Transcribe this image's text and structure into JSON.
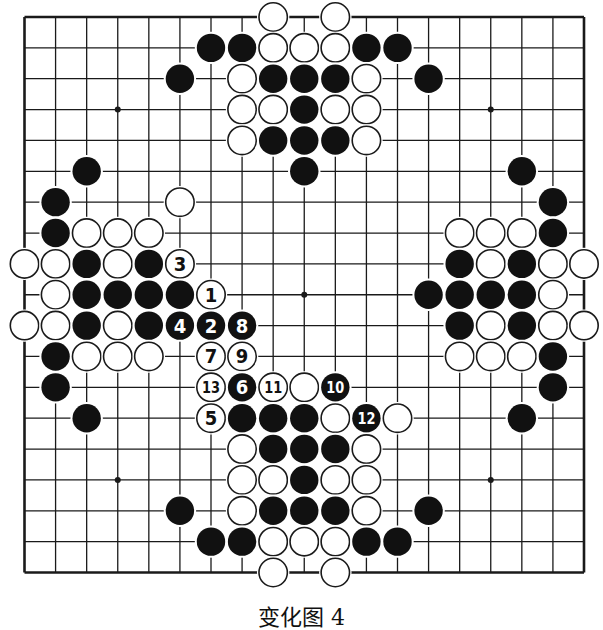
{
  "figure": {
    "caption": "变化图 4",
    "board_size": 19,
    "colors": {
      "background": "#ffffff",
      "line": "#1a1a1a",
      "black_stone": "#111111",
      "white_stone": "#ffffff",
      "stone_outline": "#1a1a1a"
    },
    "star_points": [
      [
        3,
        3
      ],
      [
        15,
        3
      ],
      [
        9,
        9
      ],
      [
        3,
        15
      ],
      [
        15,
        15
      ]
    ],
    "stones": [
      {
        "c": 8,
        "r": 0,
        "color": "W"
      },
      {
        "c": 10,
        "r": 0,
        "color": "W"
      },
      {
        "c": 6,
        "r": 1,
        "color": "B"
      },
      {
        "c": 7,
        "r": 1,
        "color": "B"
      },
      {
        "c": 8,
        "r": 1,
        "color": "W"
      },
      {
        "c": 9,
        "r": 1,
        "color": "W"
      },
      {
        "c": 10,
        "r": 1,
        "color": "W"
      },
      {
        "c": 11,
        "r": 1,
        "color": "B"
      },
      {
        "c": 12,
        "r": 1,
        "color": "B"
      },
      {
        "c": 5,
        "r": 2,
        "color": "B"
      },
      {
        "c": 7,
        "r": 2,
        "color": "W"
      },
      {
        "c": 8,
        "r": 2,
        "color": "B"
      },
      {
        "c": 9,
        "r": 2,
        "color": "B"
      },
      {
        "c": 10,
        "r": 2,
        "color": "B"
      },
      {
        "c": 11,
        "r": 2,
        "color": "W"
      },
      {
        "c": 13,
        "r": 2,
        "color": "B"
      },
      {
        "c": 7,
        "r": 3,
        "color": "W"
      },
      {
        "c": 8,
        "r": 3,
        "color": "W"
      },
      {
        "c": 9,
        "r": 3,
        "color": "B"
      },
      {
        "c": 10,
        "r": 3,
        "color": "W"
      },
      {
        "c": 11,
        "r": 3,
        "color": "W"
      },
      {
        "c": 7,
        "r": 4,
        "color": "W"
      },
      {
        "c": 8,
        "r": 4,
        "color": "B"
      },
      {
        "c": 9,
        "r": 4,
        "color": "B"
      },
      {
        "c": 10,
        "r": 4,
        "color": "B"
      },
      {
        "c": 11,
        "r": 4,
        "color": "W"
      },
      {
        "c": 2,
        "r": 5,
        "color": "B"
      },
      {
        "c": 9,
        "r": 5,
        "color": "B"
      },
      {
        "c": 16,
        "r": 5,
        "color": "B"
      },
      {
        "c": 1,
        "r": 6,
        "color": "B"
      },
      {
        "c": 5,
        "r": 6,
        "color": "W"
      },
      {
        "c": 17,
        "r": 6,
        "color": "B"
      },
      {
        "c": 1,
        "r": 7,
        "color": "B"
      },
      {
        "c": 2,
        "r": 7,
        "color": "W"
      },
      {
        "c": 3,
        "r": 7,
        "color": "W"
      },
      {
        "c": 4,
        "r": 7,
        "color": "W"
      },
      {
        "c": 14,
        "r": 7,
        "color": "W"
      },
      {
        "c": 15,
        "r": 7,
        "color": "W"
      },
      {
        "c": 16,
        "r": 7,
        "color": "W"
      },
      {
        "c": 17,
        "r": 7,
        "color": "B"
      },
      {
        "c": 0,
        "r": 8,
        "color": "W"
      },
      {
        "c": 1,
        "r": 8,
        "color": "W"
      },
      {
        "c": 2,
        "r": 8,
        "color": "B"
      },
      {
        "c": 3,
        "r": 8,
        "color": "W"
      },
      {
        "c": 4,
        "r": 8,
        "color": "B"
      },
      {
        "c": 5,
        "r": 8,
        "color": "W",
        "label": "3"
      },
      {
        "c": 14,
        "r": 8,
        "color": "B"
      },
      {
        "c": 15,
        "r": 8,
        "color": "W"
      },
      {
        "c": 16,
        "r": 8,
        "color": "B"
      },
      {
        "c": 17,
        "r": 8,
        "color": "W"
      },
      {
        "c": 18,
        "r": 8,
        "color": "W"
      },
      {
        "c": 1,
        "r": 9,
        "color": "W"
      },
      {
        "c": 2,
        "r": 9,
        "color": "B"
      },
      {
        "c": 3,
        "r": 9,
        "color": "B"
      },
      {
        "c": 4,
        "r": 9,
        "color": "B"
      },
      {
        "c": 5,
        "r": 9,
        "color": "B"
      },
      {
        "c": 6,
        "r": 9,
        "color": "W",
        "label": "1"
      },
      {
        "c": 13,
        "r": 9,
        "color": "B"
      },
      {
        "c": 14,
        "r": 9,
        "color": "B"
      },
      {
        "c": 15,
        "r": 9,
        "color": "B"
      },
      {
        "c": 16,
        "r": 9,
        "color": "B"
      },
      {
        "c": 17,
        "r": 9,
        "color": "W"
      },
      {
        "c": 0,
        "r": 10,
        "color": "W"
      },
      {
        "c": 1,
        "r": 10,
        "color": "W"
      },
      {
        "c": 2,
        "r": 10,
        "color": "B"
      },
      {
        "c": 3,
        "r": 10,
        "color": "W"
      },
      {
        "c": 4,
        "r": 10,
        "color": "B"
      },
      {
        "c": 5,
        "r": 10,
        "color": "B",
        "label": "4"
      },
      {
        "c": 6,
        "r": 10,
        "color": "B",
        "label": "2"
      },
      {
        "c": 7,
        "r": 10,
        "color": "B",
        "label": "8"
      },
      {
        "c": 14,
        "r": 10,
        "color": "B"
      },
      {
        "c": 15,
        "r": 10,
        "color": "W"
      },
      {
        "c": 16,
        "r": 10,
        "color": "B"
      },
      {
        "c": 17,
        "r": 10,
        "color": "W"
      },
      {
        "c": 18,
        "r": 10,
        "color": "W"
      },
      {
        "c": 1,
        "r": 11,
        "color": "B"
      },
      {
        "c": 2,
        "r": 11,
        "color": "W"
      },
      {
        "c": 3,
        "r": 11,
        "color": "W"
      },
      {
        "c": 4,
        "r": 11,
        "color": "W"
      },
      {
        "c": 6,
        "r": 11,
        "color": "W",
        "label": "7"
      },
      {
        "c": 7,
        "r": 11,
        "color": "W",
        "label": "9"
      },
      {
        "c": 14,
        "r": 11,
        "color": "W"
      },
      {
        "c": 15,
        "r": 11,
        "color": "W"
      },
      {
        "c": 16,
        "r": 11,
        "color": "W"
      },
      {
        "c": 17,
        "r": 11,
        "color": "B"
      },
      {
        "c": 1,
        "r": 12,
        "color": "B"
      },
      {
        "c": 6,
        "r": 12,
        "color": "W",
        "label": "13"
      },
      {
        "c": 7,
        "r": 12,
        "color": "B",
        "label": "6"
      },
      {
        "c": 8,
        "r": 12,
        "color": "W",
        "label": "11"
      },
      {
        "c": 9,
        "r": 12,
        "color": "W"
      },
      {
        "c": 10,
        "r": 12,
        "color": "B",
        "label": "10"
      },
      {
        "c": 17,
        "r": 12,
        "color": "B"
      },
      {
        "c": 2,
        "r": 13,
        "color": "B"
      },
      {
        "c": 6,
        "r": 13,
        "color": "W",
        "label": "5"
      },
      {
        "c": 7,
        "r": 13,
        "color": "B"
      },
      {
        "c": 8,
        "r": 13,
        "color": "B"
      },
      {
        "c": 9,
        "r": 13,
        "color": "B"
      },
      {
        "c": 10,
        "r": 13,
        "color": "W"
      },
      {
        "c": 11,
        "r": 13,
        "color": "B",
        "label": "12"
      },
      {
        "c": 12,
        "r": 13,
        "color": "W"
      },
      {
        "c": 16,
        "r": 13,
        "color": "B"
      },
      {
        "c": 7,
        "r": 14,
        "color": "W"
      },
      {
        "c": 8,
        "r": 14,
        "color": "B"
      },
      {
        "c": 9,
        "r": 14,
        "color": "B"
      },
      {
        "c": 10,
        "r": 14,
        "color": "B"
      },
      {
        "c": 11,
        "r": 14,
        "color": "W"
      },
      {
        "c": 7,
        "r": 15,
        "color": "W"
      },
      {
        "c": 8,
        "r": 15,
        "color": "W"
      },
      {
        "c": 9,
        "r": 15,
        "color": "B"
      },
      {
        "c": 10,
        "r": 15,
        "color": "W"
      },
      {
        "c": 11,
        "r": 15,
        "color": "W"
      },
      {
        "c": 5,
        "r": 16,
        "color": "B"
      },
      {
        "c": 7,
        "r": 16,
        "color": "W"
      },
      {
        "c": 8,
        "r": 16,
        "color": "B"
      },
      {
        "c": 9,
        "r": 16,
        "color": "B"
      },
      {
        "c": 10,
        "r": 16,
        "color": "B"
      },
      {
        "c": 11,
        "r": 16,
        "color": "W"
      },
      {
        "c": 13,
        "r": 16,
        "color": "B"
      },
      {
        "c": 6,
        "r": 17,
        "color": "B"
      },
      {
        "c": 7,
        "r": 17,
        "color": "B"
      },
      {
        "c": 8,
        "r": 17,
        "color": "W"
      },
      {
        "c": 9,
        "r": 17,
        "color": "W"
      },
      {
        "c": 10,
        "r": 17,
        "color": "W"
      },
      {
        "c": 11,
        "r": 17,
        "color": "B"
      },
      {
        "c": 12,
        "r": 17,
        "color": "B"
      },
      {
        "c": 8,
        "r": 18,
        "color": "W"
      },
      {
        "c": 10,
        "r": 18,
        "color": "W"
      }
    ]
  }
}
